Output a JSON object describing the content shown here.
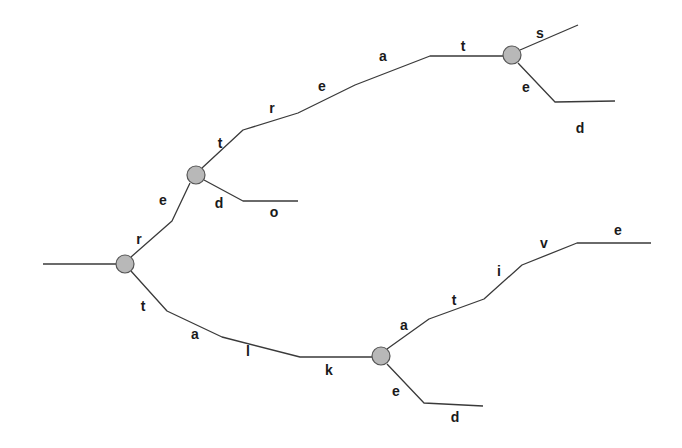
{
  "diagram": {
    "type": "trie",
    "words": [
      "retreats",
      "retreated",
      "redo",
      "talk",
      "talkative",
      "talked"
    ],
    "colors": {
      "edge": "#3a3a3a",
      "node_fill": "#b8b8b8",
      "node_stroke": "#555555"
    },
    "nodes": [
      {
        "id": "n1",
        "x": 125,
        "y": 264
      },
      {
        "id": "n2",
        "x": 196,
        "y": 175
      },
      {
        "id": "n3",
        "x": 512,
        "y": 55
      },
      {
        "id": "n4",
        "x": 381,
        "y": 356
      }
    ],
    "edges": [
      {
        "id": "root-in",
        "points": "43,264 116,264"
      },
      {
        "id": "re-path",
        "points": "131,257 172,221 190,183"
      },
      {
        "id": "treat-path",
        "points": "202,168 243,130 298,113 355,85 430,56 503,56"
      },
      {
        "id": "s-branch",
        "points": "520,50 578,25"
      },
      {
        "id": "ed-branch",
        "points": "518,63 555,102 615,101"
      },
      {
        "id": "do-branch",
        "points": "204,180 243,201 298,201"
      },
      {
        "id": "talk-path",
        "points": "131,271 167,311 222,337 300,357 372,357"
      },
      {
        "id": "ative-path",
        "points": "387,349 429,319 484,299 522,265 577,243 651,243"
      },
      {
        "id": "ed2-branch",
        "points": "387,364 424,403 483,406"
      }
    ],
    "labels": [
      {
        "text": "r",
        "x": 139,
        "y": 239
      },
      {
        "text": "e",
        "x": 163,
        "y": 200
      },
      {
        "text": "t",
        "x": 220,
        "y": 143
      },
      {
        "text": "r",
        "x": 272,
        "y": 108
      },
      {
        "text": "e",
        "x": 322,
        "y": 86
      },
      {
        "text": "a",
        "x": 383,
        "y": 56
      },
      {
        "text": "t",
        "x": 463,
        "y": 46
      },
      {
        "text": "s",
        "x": 540,
        "y": 33
      },
      {
        "text": "e",
        "x": 526,
        "y": 87
      },
      {
        "text": "d",
        "x": 580,
        "y": 128
      },
      {
        "text": "d",
        "x": 219,
        "y": 203
      },
      {
        "text": "o",
        "x": 274,
        "y": 212
      },
      {
        "text": "t",
        "x": 143,
        "y": 306
      },
      {
        "text": "a",
        "x": 195,
        "y": 334
      },
      {
        "text": "l",
        "x": 248,
        "y": 351
      },
      {
        "text": "k",
        "x": 329,
        "y": 370
      },
      {
        "text": "a",
        "x": 404,
        "y": 325
      },
      {
        "text": "t",
        "x": 454,
        "y": 300
      },
      {
        "text": "i",
        "x": 499,
        "y": 271
      },
      {
        "text": "v",
        "x": 544,
        "y": 243
      },
      {
        "text": "e",
        "x": 618,
        "y": 230
      },
      {
        "text": "e",
        "x": 396,
        "y": 391
      },
      {
        "text": "d",
        "x": 455,
        "y": 417
      }
    ]
  }
}
